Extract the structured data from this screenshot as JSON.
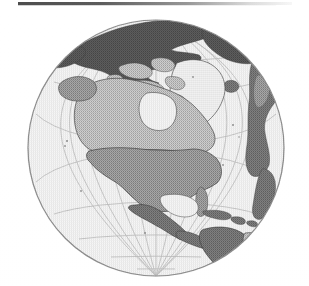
{
  "figure": {
    "kind": "orthographic-globe-map",
    "title": "Orthographic globe projection centered on North America",
    "background_color": "#ffffff",
    "scan_artifact_bar": {
      "present": true,
      "color": "#3a3a3a",
      "position": "top-edge"
    }
  },
  "globe": {
    "projection": "orthographic",
    "center_latitude": "45N",
    "center_longitude": "95W",
    "center_x_px": 156,
    "center_y_px": 148,
    "radius_px": 129,
    "ocean_fill": "#f4f4f4",
    "limb_stroke": "#8a8a8a",
    "graticule": {
      "visible": true,
      "stroke": "#c0c0c0",
      "meridian_interval_degrees": 15,
      "parallel_interval_degrees": 15,
      "meridian_count": 12,
      "parallel_count": 11
    }
  },
  "legend": {
    "shades": [
      {
        "name": "ocean",
        "color": "#f4f4f4",
        "label": "Ocean / water"
      },
      {
        "name": "land-light",
        "color": "#dcdcdc",
        "label": "Land (lightest tone)"
      },
      {
        "name": "land-mid-light",
        "color": "#bdbdbd",
        "label": "Land (light gray tone)"
      },
      {
        "name": "land-mid",
        "color": "#9a9a9a",
        "label": "Land (medium gray tone)"
      },
      {
        "name": "land-dark",
        "color": "#6e6e6e",
        "label": "Land (dark gray tone)"
      },
      {
        "name": "land-darkest",
        "color": "#4d4d4d",
        "label": "Land (darkest tone)"
      }
    ]
  },
  "landmasses": [
    {
      "name": "canada",
      "label": "Canada",
      "shade": "#bdbdbd"
    },
    {
      "name": "united-states",
      "label": "United States",
      "shade": "#8f8f8f"
    },
    {
      "name": "alaska",
      "label": "Alaska",
      "shade": "#8f8f8f"
    },
    {
      "name": "greenland",
      "label": "Greenland",
      "shade": "#ededed"
    },
    {
      "name": "mexico",
      "label": "Mexico",
      "shade": "#6e6e6e"
    },
    {
      "name": "central-america",
      "label": "Central America",
      "shade": "#6e6e6e"
    },
    {
      "name": "caribbean-islands",
      "label": "Caribbean Islands",
      "shade": "#7a7a7a"
    },
    {
      "name": "colombia-venezuela",
      "label": "Northern South America",
      "shade": "#5f5f5f"
    },
    {
      "name": "brazil",
      "label": "Brazil",
      "shade": "#a8a8a8"
    },
    {
      "name": "siberia-russia",
      "label": "Siberia / Russia",
      "shade": "#4d4d4d"
    },
    {
      "name": "scandinavia-europe",
      "label": "Northern Europe",
      "shade": "#5a5a5a"
    },
    {
      "name": "northwest-africa",
      "label": "Northwest Africa",
      "shade": "#6a6a6a"
    },
    {
      "name": "iceland",
      "label": "Iceland",
      "shade": "#707070"
    },
    {
      "name": "arctic-islands",
      "label": "Canadian Arctic Archipelago",
      "shade": "#b5b5b5"
    }
  ]
}
